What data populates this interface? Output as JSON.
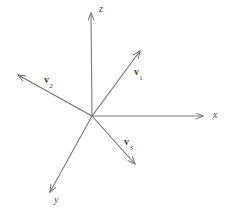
{
  "figure": {
    "type": "vector-diagram",
    "width": 227,
    "height": 215,
    "background_color": "#ffffff",
    "stroke_color": "#777777",
    "label_color": "#3d3d3d",
    "origin": {
      "x": 92,
      "y": 116
    },
    "axes": [
      {
        "id": "z-axis",
        "label": "z",
        "tip": {
          "x": 91,
          "y": 8
        },
        "label_pos": {
          "x": 99,
          "y": 5
        }
      },
      {
        "id": "x-axis",
        "label": "x",
        "tip": {
          "x": 208,
          "y": 116
        },
        "label_pos": {
          "x": 213,
          "y": 111
        }
      },
      {
        "id": "y-axis",
        "label": "y",
        "tip": {
          "x": 46,
          "y": 197
        },
        "label_pos": {
          "x": 54,
          "y": 196
        }
      }
    ],
    "vectors": [
      {
        "id": "v1",
        "name": "v",
        "subscript": "1",
        "tip": {
          "x": 144,
          "y": 46
        },
        "label_pos": {
          "x": 134,
          "y": 67
        }
      },
      {
        "id": "v2",
        "name": "v",
        "subscript": "2",
        "tip": {
          "x": 13,
          "y": 72
        },
        "label_pos": {
          "x": 44,
          "y": 75
        }
      },
      {
        "id": "v3",
        "name": "v",
        "subscript": "3",
        "tip": {
          "x": 139,
          "y": 169
        },
        "label_pos": {
          "x": 124,
          "y": 137
        }
      }
    ]
  }
}
